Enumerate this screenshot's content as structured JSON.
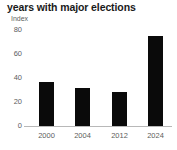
{
  "chart_data": {
    "type": "bar",
    "title": "years with major elections",
    "subtitle": "",
    "ylabel": "Index",
    "xlabel": "",
    "categories": [
      "2000",
      "2004",
      "2012",
      "2024"
    ],
    "values": [
      37,
      32,
      28,
      75
    ],
    "ylim": [
      0,
      80
    ],
    "yticks": [
      0,
      20,
      40,
      60,
      80
    ],
    "ytick_labels": [
      "0",
      "20",
      "40",
      "60",
      "80"
    ],
    "grid": false,
    "legend": null,
    "bar_color": "#0a0a0a",
    "axis_color": "#b8b8b8",
    "text_color": "#5d5d5d",
    "title_color": "#1a1a1a"
  }
}
